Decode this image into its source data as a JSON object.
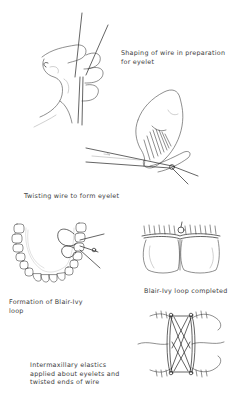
{
  "figures": [
    {
      "id": "shaping-wire",
      "caption": "Shaping of wire in preparation\nfor eyelet"
    },
    {
      "id": "twisting-wire",
      "caption": "Twisting wire to form eyelet"
    },
    {
      "id": "formation-loop",
      "caption": "Formation of Blair-Ivy\nloop"
    },
    {
      "id": "loop-completed",
      "caption": "Blair-Ivy loop completed"
    },
    {
      "id": "intermaxillary-elastics",
      "caption": "Intermaxillary elastics\napplied about eyelets and\ntwisted ends of wire"
    }
  ]
}
